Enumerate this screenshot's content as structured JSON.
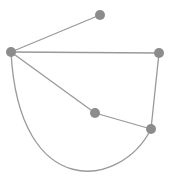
{
  "graph": {
    "node_color": "#8c8c8c",
    "edge_color": "#999999",
    "nodes": [
      {
        "id": "A",
        "x": 11,
        "y": 52,
        "r": 5
      },
      {
        "id": "B",
        "x": 100,
        "y": 15,
        "r": 5
      },
      {
        "id": "C",
        "x": 159,
        "y": 53,
        "r": 5
      },
      {
        "id": "D",
        "x": 95,
        "y": 113,
        "r": 5
      },
      {
        "id": "E",
        "x": 151,
        "y": 129,
        "r": 5
      }
    ],
    "edges": [
      {
        "from": "A",
        "to": "B",
        "type": "straight"
      },
      {
        "from": "A",
        "to": "C",
        "type": "straight"
      },
      {
        "from": "A",
        "to": "D",
        "type": "straight"
      },
      {
        "from": "C",
        "to": "E",
        "type": "straight"
      },
      {
        "from": "D",
        "to": "E",
        "type": "straight"
      },
      {
        "from": "A",
        "to": "E",
        "type": "curved"
      }
    ]
  }
}
